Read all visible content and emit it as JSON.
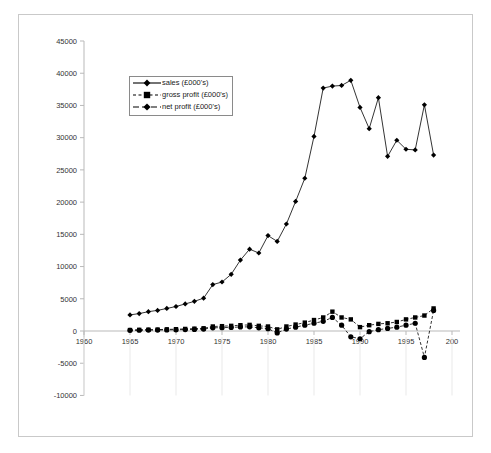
{
  "chart_data": {
    "type": "line",
    "title": "",
    "subtitle": "",
    "xlabel": "",
    "ylabel": "",
    "xlim": [
      1960,
      2000
    ],
    "ylim": [
      -10000,
      45000
    ],
    "xticks": [
      1960,
      1965,
      1970,
      1975,
      1980,
      1985,
      1990,
      1995,
      2000
    ],
    "xticklabels": [
      "1960",
      "1965",
      "1970",
      "1975",
      "1980",
      "1985",
      "1990",
      "1995",
      "200"
    ],
    "yticks": [
      -10000,
      -5000,
      0,
      5000,
      10000,
      15000,
      20000,
      25000,
      30000,
      35000,
      40000,
      45000
    ],
    "yticklabels": [
      "-10000",
      "-5000",
      "0",
      "5000",
      "10000",
      "15000",
      "20000",
      "25000",
      "30000",
      "35000",
      "40000",
      "45000"
    ],
    "grid": false,
    "legend_position": "upper-left-inset",
    "x": [
      1965,
      1966,
      1967,
      1968,
      1969,
      1970,
      1971,
      1972,
      1973,
      1974,
      1975,
      1976,
      1977,
      1978,
      1979,
      1980,
      1981,
      1982,
      1983,
      1984,
      1985,
      1986,
      1987,
      1988,
      1989,
      1990,
      1991,
      1992,
      1993,
      1994,
      1995,
      1996,
      1997,
      1998
    ],
    "series": [
      {
        "name": "sales (£000's)",
        "marker": "diamond",
        "linestyle": "solid",
        "color": "#000000",
        "values": [
          2500,
          2700,
          3000,
          3200,
          3500,
          3800,
          4200,
          4600,
          5100,
          7200,
          7600,
          8800,
          11000,
          12700,
          12100,
          14800,
          13900,
          16600,
          20100,
          23700,
          30200,
          37700,
          38000,
          38100,
          38900,
          34700,
          31400,
          36200,
          27100,
          29600,
          28200,
          28100,
          35100,
          27300
        ]
      },
      {
        "name": "gross profit (£000's)",
        "marker": "square",
        "linestyle": "dashed",
        "color": "#000000",
        "values": [
          150,
          180,
          200,
          220,
          250,
          280,
          320,
          360,
          420,
          700,
          750,
          800,
          900,
          950,
          800,
          700,
          250,
          700,
          1000,
          1300,
          1700,
          2100,
          3000,
          2100,
          1800,
          600,
          900,
          1100,
          1200,
          1400,
          1800,
          2100,
          2400,
          3500
        ]
      },
      {
        "name": "net profit (£000's)",
        "marker": "circle",
        "linestyle": "dashed",
        "color": "#000000",
        "values": [
          100,
          120,
          140,
          150,
          170,
          190,
          220,
          250,
          300,
          500,
          520,
          560,
          620,
          650,
          500,
          350,
          -300,
          300,
          600,
          900,
          1200,
          1500,
          2100,
          900,
          -900,
          -1200,
          -100,
          200,
          400,
          600,
          900,
          1200,
          -4100,
          3200
        ]
      }
    ]
  },
  "legend": {
    "items": [
      {
        "label": "sales (£000's)",
        "marker": "diamond",
        "linestyle": "solid"
      },
      {
        "label": "gross profit (£000's)",
        "marker": "square",
        "linestyle": "dashed"
      },
      {
        "label": "net profit (£000's)",
        "marker": "circle",
        "linestyle": "dashed-long"
      }
    ]
  }
}
